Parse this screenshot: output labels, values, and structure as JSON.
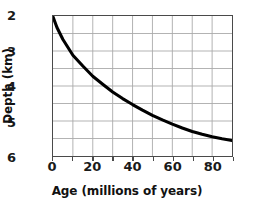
{
  "chart_data": {
    "type": "line",
    "title": "",
    "xlabel": "Age (millions of years)",
    "ylabel": "Depth (km)",
    "xlim": [
      0,
      90
    ],
    "ylim": [
      2,
      6
    ],
    "y_inverted": true,
    "grid": true,
    "legend": "none",
    "x_ticks": [
      0,
      20,
      40,
      60,
      80
    ],
    "x_tick_labels": [
      "0",
      "20",
      "40",
      "60",
      "80"
    ],
    "y_ticks": [
      2,
      3,
      4,
      5,
      6
    ],
    "y_tick_labels": [
      "2",
      "3",
      "4",
      "5",
      "6"
    ],
    "x_gridlines": [
      0,
      10,
      20,
      30,
      40,
      50,
      60,
      70,
      80,
      90
    ],
    "y_gridlines": [
      2.0,
      2.5,
      3.0,
      3.5,
      4.0,
      4.5,
      5.0,
      5.5,
      6.0
    ],
    "series": [
      {
        "name": "Ocean floor depth",
        "color": "#000000",
        "x": [
          0,
          2,
          5,
          10,
          15,
          20,
          25,
          30,
          35,
          40,
          45,
          50,
          55,
          60,
          65,
          70,
          75,
          80,
          85,
          90
        ],
        "values": [
          2.02,
          2.33,
          2.67,
          3.12,
          3.43,
          3.72,
          3.95,
          4.17,
          4.36,
          4.53,
          4.69,
          4.84,
          4.97,
          5.09,
          5.2,
          5.3,
          5.38,
          5.45,
          5.51,
          5.56
        ]
      }
    ]
  },
  "axes": {
    "x_title": "Age (millions of years)",
    "y_title": "Depth (km)",
    "x_tick_labels": [
      "0",
      "20",
      "40",
      "60",
      "80"
    ],
    "y_tick_labels": [
      "2",
      "3",
      "4",
      "5",
      "6"
    ]
  },
  "colors": {
    "curve": "#000000",
    "grid": "#a9a9a9",
    "axis_border": "#4a4a4a",
    "text": "#111111",
    "background": "#ffffff"
  }
}
